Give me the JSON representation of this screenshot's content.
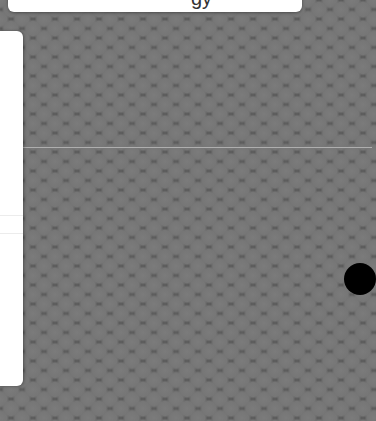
{
  "top_panel": {
    "partial_text": "gy"
  },
  "side_panel": {
    "dividers": 2
  },
  "map": {
    "pattern": "hexagonal-dot-grid",
    "background_color": "#585858",
    "dot_color": "#7b7b7b",
    "gridline_color": "#dcdcdc"
  },
  "marker": {
    "color": "#000000",
    "shape": "circle"
  }
}
